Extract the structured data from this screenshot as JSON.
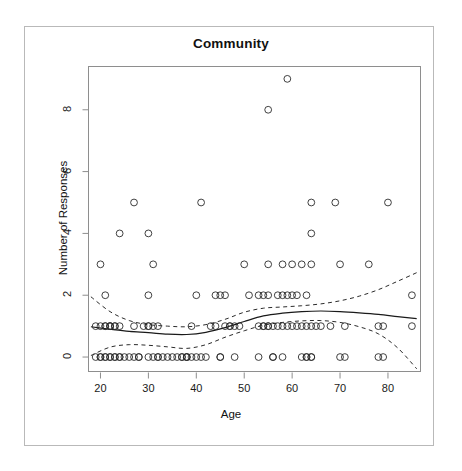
{
  "figure": {
    "title": "Community",
    "x_axis_label": "Age",
    "y_axis_label": "Number of Responses"
  },
  "axes": {
    "x_ticks": [
      20,
      30,
      40,
      50,
      60,
      70,
      80
    ],
    "y_ticks": [
      0,
      2,
      4,
      6,
      8
    ]
  },
  "chart_data": {
    "type": "scatter",
    "title": "Community",
    "xlabel": "Age",
    "ylabel": "Number of Responses",
    "xlim": [
      17.5,
      87
    ],
    "ylim": [
      -0.5,
      9.4
    ],
    "xticks": [
      20,
      30,
      40,
      50,
      60,
      70,
      80
    ],
    "yticks": [
      0,
      2,
      4,
      6,
      8
    ],
    "grid": false,
    "legend": null,
    "marker": "open-circle",
    "points": [
      [
        59,
        9
      ],
      [
        55,
        8
      ],
      [
        27,
        5
      ],
      [
        41,
        5
      ],
      [
        64,
        5
      ],
      [
        69,
        5
      ],
      [
        80,
        5
      ],
      [
        24,
        4
      ],
      [
        30,
        4
      ],
      [
        64,
        4
      ],
      [
        20,
        3
      ],
      [
        31,
        3
      ],
      [
        50,
        3
      ],
      [
        55,
        3
      ],
      [
        58,
        3
      ],
      [
        60,
        3
      ],
      [
        62,
        3
      ],
      [
        64,
        3
      ],
      [
        70,
        3
      ],
      [
        76,
        3
      ],
      [
        21,
        2
      ],
      [
        30,
        2
      ],
      [
        40,
        2
      ],
      [
        44,
        2
      ],
      [
        45,
        2
      ],
      [
        46,
        2
      ],
      [
        51,
        2
      ],
      [
        53,
        2
      ],
      [
        54,
        2
      ],
      [
        55,
        2
      ],
      [
        57,
        2
      ],
      [
        58,
        2
      ],
      [
        59,
        2
      ],
      [
        60,
        2
      ],
      [
        61,
        2
      ],
      [
        63,
        2
      ],
      [
        85,
        2
      ],
      [
        19,
        1
      ],
      [
        20,
        1
      ],
      [
        21,
        1
      ],
      [
        21,
        1
      ],
      [
        22,
        1
      ],
      [
        22,
        1
      ],
      [
        22,
        1
      ],
      [
        23,
        1
      ],
      [
        23,
        1
      ],
      [
        24,
        1
      ],
      [
        27,
        1
      ],
      [
        29,
        1
      ],
      [
        30,
        1
      ],
      [
        30,
        1
      ],
      [
        31,
        1
      ],
      [
        32,
        1
      ],
      [
        39,
        1
      ],
      [
        43,
        1
      ],
      [
        44,
        1
      ],
      [
        46,
        1
      ],
      [
        47,
        1
      ],
      [
        47,
        1
      ],
      [
        48,
        1
      ],
      [
        49,
        1
      ],
      [
        53,
        1
      ],
      [
        54,
        1
      ],
      [
        54,
        1
      ],
      [
        55,
        1
      ],
      [
        55,
        1
      ],
      [
        56,
        1
      ],
      [
        57,
        1
      ],
      [
        58,
        1
      ],
      [
        59,
        1
      ],
      [
        60,
        1
      ],
      [
        61,
        1
      ],
      [
        62,
        1
      ],
      [
        63,
        1
      ],
      [
        64,
        1
      ],
      [
        65,
        1
      ],
      [
        66,
        1
      ],
      [
        68,
        1
      ],
      [
        71,
        1
      ],
      [
        78,
        1
      ],
      [
        79,
        1
      ],
      [
        85,
        1
      ],
      [
        19,
        0
      ],
      [
        20,
        0
      ],
      [
        20,
        0
      ],
      [
        21,
        0
      ],
      [
        21,
        0
      ],
      [
        22,
        0
      ],
      [
        22,
        0
      ],
      [
        23,
        0
      ],
      [
        23,
        0
      ],
      [
        24,
        0
      ],
      [
        24,
        0
      ],
      [
        25,
        0
      ],
      [
        26,
        0
      ],
      [
        27,
        0
      ],
      [
        28,
        0
      ],
      [
        28,
        0
      ],
      [
        30,
        0
      ],
      [
        31,
        0
      ],
      [
        32,
        0
      ],
      [
        32,
        0
      ],
      [
        33,
        0
      ],
      [
        34,
        0
      ],
      [
        35,
        0
      ],
      [
        36,
        0
      ],
      [
        37,
        0
      ],
      [
        37,
        0
      ],
      [
        38,
        0
      ],
      [
        38,
        0
      ],
      [
        38,
        0
      ],
      [
        39,
        0
      ],
      [
        40,
        0
      ],
      [
        41,
        0
      ],
      [
        42,
        0
      ],
      [
        45,
        0
      ],
      [
        45,
        0
      ],
      [
        48,
        0
      ],
      [
        53,
        0
      ],
      [
        56,
        0
      ],
      [
        56,
        0
      ],
      [
        58,
        0
      ],
      [
        62,
        0
      ],
      [
        63,
        0
      ],
      [
        63,
        0
      ],
      [
        64,
        0
      ],
      [
        64,
        0
      ],
      [
        70,
        0
      ],
      [
        71,
        0
      ],
      [
        78,
        0
      ],
      [
        79,
        0
      ]
    ],
    "fit_curve": {
      "style": "solid",
      "points": [
        [
          18,
          0.98
        ],
        [
          22,
          0.9
        ],
        [
          26,
          0.83
        ],
        [
          30,
          0.79
        ],
        [
          34,
          0.74
        ],
        [
          38,
          0.73
        ],
        [
          42,
          0.8
        ],
        [
          46,
          0.95
        ],
        [
          50,
          1.15
        ],
        [
          54,
          1.33
        ],
        [
          58,
          1.42
        ],
        [
          62,
          1.47
        ],
        [
          66,
          1.49
        ],
        [
          70,
          1.47
        ],
        [
          74,
          1.43
        ],
        [
          78,
          1.38
        ],
        [
          82,
          1.31
        ],
        [
          86,
          1.24
        ]
      ]
    },
    "confidence_bands": [
      {
        "name": "upper",
        "style": "dashed",
        "points": [
          [
            18,
            1.95
          ],
          [
            22,
            1.47
          ],
          [
            26,
            1.18
          ],
          [
            30,
            1.05
          ],
          [
            34,
            1.0
          ],
          [
            38,
            0.98
          ],
          [
            42,
            1.05
          ],
          [
            46,
            1.22
          ],
          [
            50,
            1.45
          ],
          [
            54,
            1.58
          ],
          [
            58,
            1.62
          ],
          [
            62,
            1.66
          ],
          [
            66,
            1.72
          ],
          [
            70,
            1.82
          ],
          [
            74,
            1.97
          ],
          [
            78,
            2.18
          ],
          [
            82,
            2.45
          ],
          [
            86,
            2.73
          ]
        ]
      },
      {
        "name": "lower",
        "style": "dashed",
        "points": [
          [
            18,
            0.05
          ],
          [
            22,
            0.32
          ],
          [
            26,
            0.4
          ],
          [
            30,
            0.38
          ],
          [
            34,
            0.33
          ],
          [
            38,
            0.28
          ],
          [
            42,
            0.4
          ],
          [
            46,
            0.64
          ],
          [
            50,
            0.85
          ],
          [
            54,
            1.03
          ],
          [
            58,
            1.12
          ],
          [
            62,
            1.17
          ],
          [
            66,
            1.18
          ],
          [
            70,
            1.12
          ],
          [
            74,
            0.98
          ],
          [
            78,
            0.75
          ],
          [
            82,
            0.3
          ],
          [
            86,
            -0.38
          ]
        ]
      }
    ]
  }
}
